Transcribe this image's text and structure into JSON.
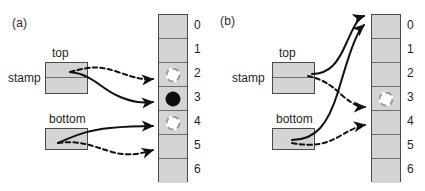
{
  "figure": {
    "panels": [
      {
        "id": "a",
        "label": "(a)",
        "stamp_label": "stamp",
        "top_label": "top",
        "bottom_label": "bottom",
        "memory_cells": [
          {
            "index": "0",
            "token": "none"
          },
          {
            "index": "1",
            "token": "none"
          },
          {
            "index": "2",
            "token": "open-circle"
          },
          {
            "index": "3",
            "token": "filled-circle"
          },
          {
            "index": "4",
            "token": "open-circle"
          },
          {
            "index": "5",
            "token": "none"
          },
          {
            "index": "6",
            "token": "none"
          }
        ],
        "arrows": [
          {
            "from": "top",
            "to_cell": "2",
            "style": "dashed"
          },
          {
            "from": "top",
            "to_cell": "3",
            "style": "solid"
          },
          {
            "from": "bottom",
            "to_cell": "4",
            "style": "solid"
          },
          {
            "from": "bottom",
            "to_cell": "5",
            "style": "dashed"
          }
        ]
      },
      {
        "id": "b",
        "label": "(b)",
        "stamp_label": "stamp",
        "top_label": "top",
        "bottom_label": "bottom",
        "memory_cells": [
          {
            "index": "0",
            "token": "none"
          },
          {
            "index": "1",
            "token": "none"
          },
          {
            "index": "2",
            "token": "none"
          },
          {
            "index": "3",
            "token": "open-circle"
          },
          {
            "index": "4",
            "token": "none"
          },
          {
            "index": "5",
            "token": "none"
          },
          {
            "index": "6",
            "token": "none"
          }
        ],
        "arrows": [
          {
            "from": "top",
            "to_cell": "0",
            "style": "solid"
          },
          {
            "from": "bottom",
            "to_cell": "0",
            "style": "solid"
          },
          {
            "from": "top",
            "to_cell": "3",
            "style": "dashed"
          },
          {
            "from": "bottom",
            "to_cell": "4",
            "style": "dashed"
          }
        ]
      }
    ],
    "colors": {
      "cell_fill": "#d4d4d4",
      "cell_border": "#4a4a4a",
      "stroke": "#111111",
      "token_open_border": "#9a9a9a",
      "token_filled": "#0d0d0d"
    }
  }
}
